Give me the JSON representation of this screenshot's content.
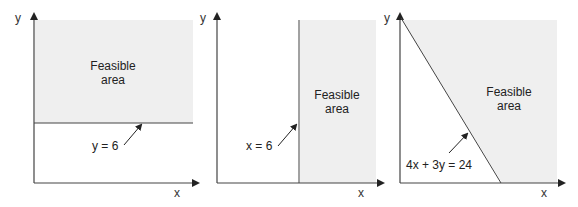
{
  "colors": {
    "feasible_fill": "#efefef",
    "line": "#333333",
    "text": "#222222"
  },
  "panels": [
    {
      "id": "panel-1",
      "x_axis_label": "x",
      "y_axis_label": "y",
      "constraint_label": "y = 6",
      "region_label_line1": "Feasible",
      "region_label_line2": "area"
    },
    {
      "id": "panel-2",
      "x_axis_label": "x",
      "y_axis_label": "y",
      "constraint_label": "x = 6",
      "region_label_line1": "Feasible",
      "region_label_line2": "area"
    },
    {
      "id": "panel-3",
      "x_axis_label": "x",
      "y_axis_label": "y",
      "constraint_label": "4x + 3y = 24",
      "region_label_line1": "Feasible",
      "region_label_line2": "area"
    }
  ]
}
